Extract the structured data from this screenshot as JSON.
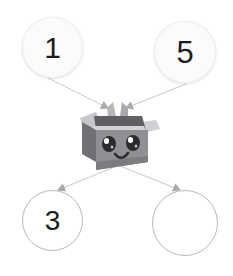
{
  "canvas": {
    "width": 233,
    "height": 276,
    "background_color": "#ffffff"
  },
  "diagram": {
    "type": "number-bond-box",
    "center_icon": "open-box-with-face-icon",
    "center_icon_description": "smiling cardboard box character",
    "nodes": [
      {
        "id": "top-left",
        "position": "top-left",
        "label": "1",
        "style": "filled",
        "filled": true
      },
      {
        "id": "top-right",
        "position": "top-right",
        "label": "5",
        "style": "filled",
        "filled": true
      },
      {
        "id": "bottom-left",
        "position": "bottom-left",
        "label": "3",
        "style": "outline",
        "filled": false
      },
      {
        "id": "bottom-right",
        "position": "bottom-right",
        "label": "",
        "style": "outline",
        "filled": false
      }
    ],
    "arrows": [
      {
        "id": "arrow-top-left-in",
        "from": "top-left",
        "to": "center",
        "direction": "into-box"
      },
      {
        "id": "arrow-top-right-in",
        "from": "top-right",
        "to": "center",
        "direction": "into-box"
      },
      {
        "id": "arrow-bottom-left-out",
        "from": "center",
        "to": "bottom-left",
        "direction": "out-of-box"
      },
      {
        "id": "arrow-bottom-right-out",
        "from": "center",
        "to": "bottom-right",
        "direction": "out-of-box"
      }
    ]
  },
  "colors": {
    "background": "#ffffff",
    "arrow_line": "#c9c9c9",
    "arrow_head": "#a9a9a9",
    "circle_filled_bg": "#fbfbfb",
    "circle_filled_border": "#f0f0f0",
    "circle_outline_border": "#b8b8b8",
    "label_text": "#1c1c1c",
    "box_front": "#8f9093",
    "box_front_dark": "#7c7d80",
    "box_left": "#6f7073",
    "box_flap_top": "#bdbec1",
    "box_flap_light": "#d2d3d6",
    "box_inner": "#5f6063",
    "eye_dark": "#2b2b2b",
    "eye_highlight": "#ffffff"
  }
}
